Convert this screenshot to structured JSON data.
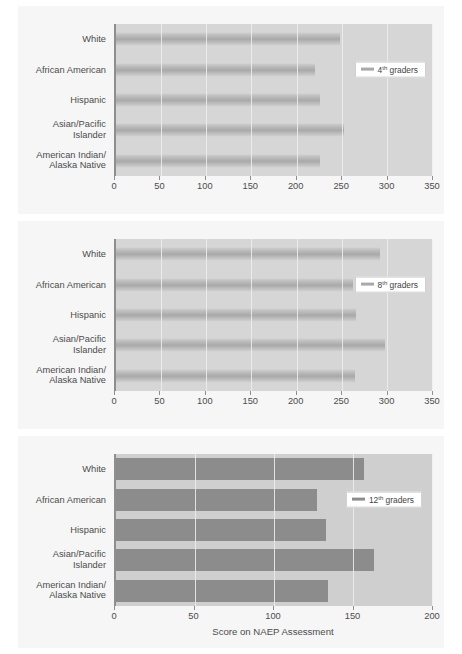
{
  "figure": {
    "xlabel": "Score on NAEP Assessment"
  },
  "categories": [
    "White",
    "African American",
    "Hispanic",
    "Asian/Pacific\nIslander",
    "American Indian/\nAlaska Native"
  ],
  "panels": [
    {
      "legend_prefix": "4",
      "legend_sup": "th",
      "legend_suffix": " graders",
      "ticks": [
        "0",
        "50",
        "100",
        "150",
        "200",
        "250",
        "300",
        "350"
      ]
    },
    {
      "legend_prefix": "8",
      "legend_sup": "th",
      "legend_suffix": " graders",
      "ticks": [
        "0",
        "50",
        "100",
        "150",
        "200",
        "250",
        "300",
        "350"
      ]
    },
    {
      "legend_prefix": "12",
      "legend_sup": "th",
      "legend_suffix": " graders",
      "ticks": [
        "0",
        "50",
        "100",
        "150",
        "200"
      ]
    }
  ],
  "chart_data": [
    {
      "type": "bar",
      "orientation": "horizontal",
      "title": "",
      "series_name": "4th graders",
      "categories": [
        "White",
        "African American",
        "Hispanic",
        "Asian/Pacific Islander",
        "American Indian/Alaska Native"
      ],
      "values": [
        248,
        220,
        226,
        252,
        226
      ],
      "xlabel": "",
      "ylabel": "",
      "xlim": [
        0,
        350
      ],
      "xticks": [
        0,
        50,
        100,
        150,
        200,
        250,
        300,
        350
      ],
      "grid": true,
      "legend_position": "right",
      "bar_color": "#a9a9a9",
      "plot_bg": "#d6d6d6"
    },
    {
      "type": "bar",
      "orientation": "horizontal",
      "title": "",
      "series_name": "8th graders",
      "categories": [
        "White",
        "African American",
        "Hispanic",
        "Asian/Pacific Islander",
        "American Indian/Alaska Native"
      ],
      "values": [
        292,
        262,
        266,
        298,
        265
      ],
      "xlabel": "",
      "ylabel": "",
      "xlim": [
        0,
        350
      ],
      "xticks": [
        0,
        50,
        100,
        150,
        200,
        250,
        300,
        350
      ],
      "grid": true,
      "legend_position": "right",
      "bar_color": "#a9a9a9",
      "plot_bg": "#d6d6d6"
    },
    {
      "type": "bar",
      "orientation": "horizontal",
      "title": "",
      "series_name": "12th graders",
      "categories": [
        "White",
        "African American",
        "Hispanic",
        "Asian/Pacific Islander",
        "American Indian/Alaska Native"
      ],
      "values": [
        157,
        127,
        133,
        163,
        134
      ],
      "xlabel": "Score on NAEP Assessment",
      "ylabel": "",
      "xlim": [
        0,
        200
      ],
      "xticks": [
        0,
        50,
        100,
        150,
        200
      ],
      "grid": true,
      "legend_position": "right",
      "bar_color": "#8c8c8c",
      "plot_bg": "#cfcfcf"
    }
  ]
}
